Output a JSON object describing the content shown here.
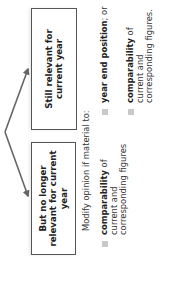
{
  "diagram": {
    "orientation": "rotated -90 degrees (text reads bottom-to-top)",
    "boxes": [
      {
        "id": "still-relevant",
        "label": "Still relevant for current year"
      },
      {
        "id": "no-longer-relevant",
        "label": "But no longer relevant for current year"
      }
    ],
    "modify_text": "Modify opinion if material to:",
    "bullets_no_longer_relevant": [
      {
        "bold": "comparability",
        "rest": " of current and corresponding figures"
      }
    ],
    "bullets_still_relevant": [
      {
        "bold": "year end position",
        "rest": "; or"
      },
      {
        "bold": "comparability",
        "rest": " of current and corresponding figures."
      }
    ],
    "colors": {
      "box_border": "#555555",
      "arrow": "#666666",
      "bullet_marker": "#c9c9c9",
      "text": "#222222"
    }
  }
}
